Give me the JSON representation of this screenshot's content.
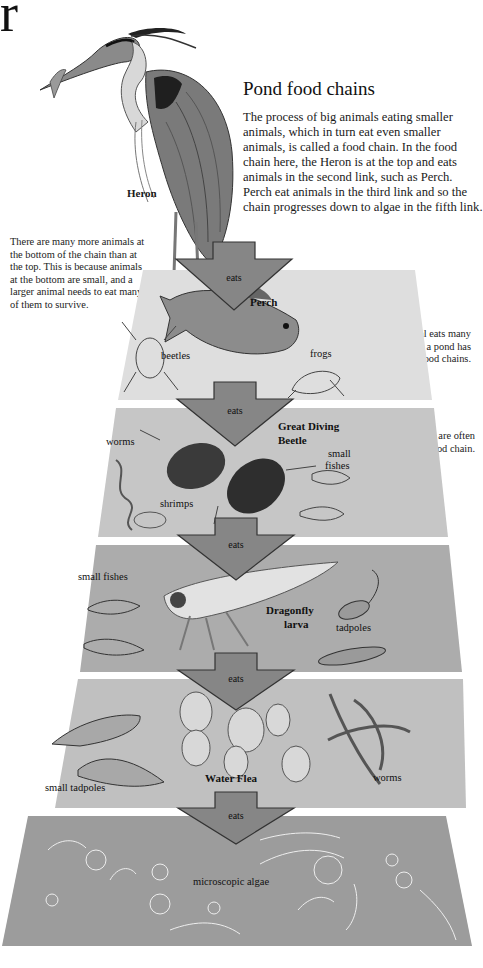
{
  "page": {
    "corner_letter": "r",
    "title": "Pond food chains",
    "intro": "The process of big animals eating smaller animals, which in turn eat even smaller animals, is called a food chain. In the food chain here, the Heron is at the top and eats animals in the second link, such as Perch. Perch eat animals in the third link and so the chain progresses down to algae in the fifth link."
  },
  "notes": {
    "left": "There are many more animals at the bottom of the chain than at the top. This is because animals at the bottom are small, and a larger animal needs to eat many of them to survive.",
    "right_1": "Each type of animal eats many different things, so a pond has many different food chains.",
    "right_2": "Plants, such as algae, are often at the bottom of a food chain."
  },
  "top": {
    "label": "Heron"
  },
  "arrow_label": "eats",
  "colors": {
    "band_1": "#dcdcdc",
    "band_2": "#c4c4c4",
    "band_3": "#acacac",
    "band_4": "#bdbdbd",
    "band_5": "#9a9a9a",
    "arrow_fill": "#868686",
    "arrow_stroke": "#333333"
  },
  "levels": [
    {
      "main": "Perch",
      "prey": [
        "beetles",
        "frogs"
      ]
    },
    {
      "main": "Great Diving Beetle",
      "main_lines": [
        "Great Diving",
        "Beetle"
      ],
      "prey": [
        "worms",
        "shrimps",
        "small fishes"
      ],
      "small_fishes_lines": [
        "small",
        "fishes"
      ]
    },
    {
      "main": "Dragonfly larva",
      "main_lines": [
        "Dragonfly",
        "larva"
      ],
      "prey": [
        "small fishes",
        "tadpoles"
      ]
    },
    {
      "main": "Water Flea",
      "prey": [
        "small tadpoles",
        "worms"
      ]
    },
    {
      "main": "microscopic algae",
      "prey": []
    }
  ]
}
